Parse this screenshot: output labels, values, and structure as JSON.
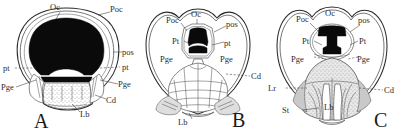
{
  "figure": {
    "background_color": "#ffffff",
    "ink_color": "#2b2b2b",
    "panels": [
      {
        "letter": "A",
        "name": "panel-a",
        "description": "Wide dark buccal cavity with stippled lower field",
        "labels": [
          {
            "id": "oc",
            "text": "Oc"
          },
          {
            "id": "poc",
            "text": "Poc"
          },
          {
            "id": "pos",
            "text": "pos"
          },
          {
            "id": "pt_r",
            "text": "pt"
          },
          {
            "id": "pt_l",
            "text": "pt"
          },
          {
            "id": "pge_l",
            "text": "Pge"
          },
          {
            "id": "pge_r",
            "text": "Pge"
          },
          {
            "id": "cd",
            "text": "Cd"
          },
          {
            "id": "lb",
            "text": "Lb"
          }
        ]
      },
      {
        "letter": "B",
        "name": "panel-b",
        "description": "Small median dark opening with segmented scaled tongue below",
        "labels": [
          {
            "id": "poc",
            "text": "Poc"
          },
          {
            "id": "oc",
            "text": "Oc"
          },
          {
            "id": "pos",
            "text": "pos"
          },
          {
            "id": "pt_l",
            "text": "Pt"
          },
          {
            "id": "pt_r",
            "text": "pt"
          },
          {
            "id": "pge_l",
            "text": "Pge"
          },
          {
            "id": "pge_r",
            "text": "Pge"
          },
          {
            "id": "cd",
            "text": "Cd"
          },
          {
            "id": "lb",
            "text": "Lb"
          }
        ]
      },
      {
        "letter": "C",
        "name": "panel-c",
        "description": "Anvil-shaped dark opening with shaded median tongue and lateral grey fields",
        "labels": [
          {
            "id": "poc",
            "text": "Poc"
          },
          {
            "id": "oc",
            "text": "Oc"
          },
          {
            "id": "pos",
            "text": "pos"
          },
          {
            "id": "pt_l",
            "text": "Pt"
          },
          {
            "id": "pt_r",
            "text": "Pt"
          },
          {
            "id": "pge_l",
            "text": "Pge"
          },
          {
            "id": "pge_r",
            "text": "Pge"
          },
          {
            "id": "lr",
            "text": "Lr"
          },
          {
            "id": "cd",
            "text": "Cd"
          },
          {
            "id": "st",
            "text": "St"
          },
          {
            "id": "lb",
            "text": "Lb"
          }
        ]
      }
    ]
  }
}
